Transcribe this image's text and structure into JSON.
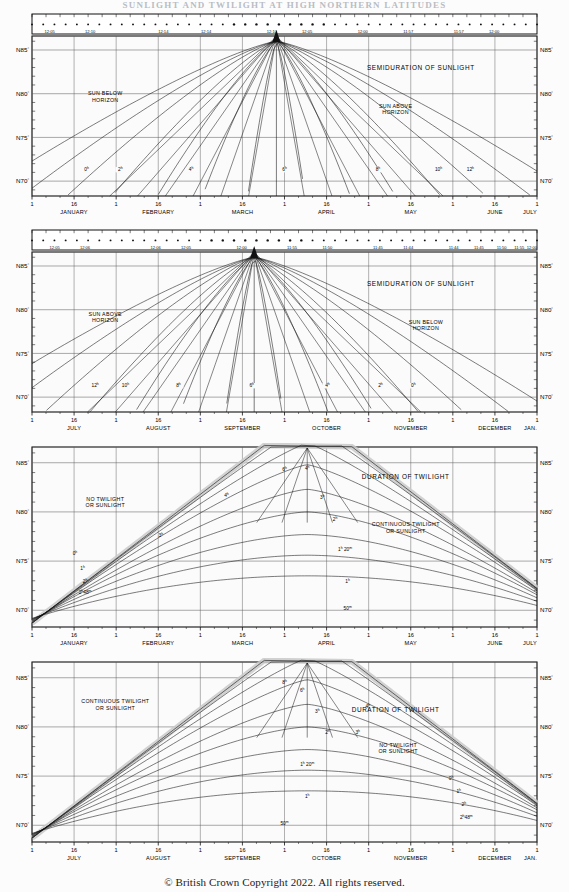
{
  "document": {
    "top_title": "SUNLIGHT AND TWILIGHT AT HIGH NORTHERN LATITUDES",
    "copyright": "© British Crown Copyright 2022. All rights reserved."
  },
  "common": {
    "latitude_ticks": [
      "N85°",
      "N80°",
      "N75°",
      "N70°"
    ],
    "latitude_values": [
      85,
      80,
      75,
      70
    ],
    "day_ticks": [
      "1",
      "16",
      "1",
      "16",
      "1",
      "16",
      "1",
      "16",
      "1",
      "16",
      "1",
      "16",
      "1"
    ],
    "degree_symbol": "°",
    "hour_symbol": "h",
    "minute_symbol": "m"
  },
  "charts": [
    {
      "id": "chart-1-semiduration-jan-jul",
      "title": "SEMIDURATION OF SUNLIGHT",
      "title_x_frac": 0.77,
      "title_y_frac": 0.21,
      "zones": [
        {
          "name": "sun-below-horizon",
          "lines": [
            "SUN BELOW",
            "HORIZON"
          ],
          "x_frac": 0.145,
          "y_frac": 0.37
        },
        {
          "name": "sun-above-horizon",
          "lines": [
            "SUN ABOVE",
            "HORIZON"
          ],
          "x_frac": 0.72,
          "y_frac": 0.45
        }
      ],
      "months": [
        "JANUARY",
        "FEBRUARY",
        "MARCH",
        "APRIL",
        "MAY",
        "JUNE",
        "JULY"
      ],
      "month_last_partial": "JULY",
      "transit_times": [
        "12:05",
        "12:10",
        "12:14",
        "12:14",
        "12:10",
        "12:05",
        "12:00",
        "11:57",
        "11:57",
        "12:00"
      ],
      "transit_time_fracs": [
        0.035,
        0.115,
        0.26,
        0.345,
        0.475,
        0.545,
        0.655,
        0.745,
        0.845,
        0.915
      ],
      "curve_labels": [
        "0h",
        "2h",
        "4h",
        "6h",
        "8h",
        "10h",
        "12h"
      ],
      "curve_label_fracs_x": [
        0.108,
        0.175,
        0.315,
        0.5,
        0.685,
        0.805,
        0.868
      ],
      "curve_label_frac_y": 0.845,
      "apex_x_frac": 0.484
    },
    {
      "id": "chart-2-semiduration-jul-dec",
      "title": "SEMIDURATION OF SUNLIGHT",
      "title_x_frac": 0.77,
      "title_y_frac": 0.21,
      "zones": [
        {
          "name": "sun-above-horizon",
          "lines": [
            "SUN ABOVE",
            "HORIZON"
          ],
          "x_frac": 0.145,
          "y_frac": 0.4
        },
        {
          "name": "sun-below-horizon",
          "lines": [
            "SUN BELOW",
            "HORIZON"
          ],
          "x_frac": 0.78,
          "y_frac": 0.45
        }
      ],
      "months": [
        "JULY",
        "AUGUST",
        "SEPTEMBER",
        "OCTOBER",
        "NOVEMBER",
        "DECEMBER",
        "JAN."
      ],
      "month_last_partial": "JAN.",
      "transit_times": [
        "12:05",
        "12:06",
        "12:06",
        "12:05",
        "12:00",
        "11:55",
        "11:50",
        "11:45",
        "11:44",
        "11:44",
        "11:45",
        "11:50",
        "11:55",
        "12:00"
      ],
      "transit_time_fracs": [
        0.045,
        0.105,
        0.245,
        0.305,
        0.415,
        0.515,
        0.585,
        0.685,
        0.745,
        0.835,
        0.885,
        0.93,
        0.965,
        0.99
      ],
      "curve_labels": [
        "12h",
        "10h",
        "8h",
        "6h",
        "4h",
        "2h",
        "0h"
      ],
      "curve_label_fracs_x": [
        0.125,
        0.185,
        0.29,
        0.435,
        0.585,
        0.69,
        0.755
      ],
      "curve_label_frac_y": 0.845,
      "apex_x_frac": 0.44
    },
    {
      "id": "chart-3-twilight-jan-jul",
      "title": "DURATION OF TWILIGHT",
      "title_x_frac": 0.74,
      "title_y_frac": 0.18,
      "zones": [
        {
          "name": "no-twilight-or-sunlight",
          "lines": [
            "NO TWILIGHT",
            "OR SUNLIGHT"
          ],
          "x_frac": 0.145,
          "y_frac": 0.3
        },
        {
          "name": "continuous-twilight-or-sunlight",
          "lines": [
            "CONTINUOUS TWILIGHT",
            "OR SUNLIGHT"
          ],
          "x_frac": 0.74,
          "y_frac": 0.44
        }
      ],
      "months": [
        "JANUARY",
        "FEBRUARY",
        "MARCH",
        "APRIL",
        "MAY",
        "JUNE",
        "JULY"
      ],
      "month_last_partial": "JULY",
      "curve_labels": [
        "0h",
        "1h",
        "2h",
        "2h48m",
        "3h",
        "4h",
        "6h",
        "4h",
        "3h",
        "2h",
        "1h 20m",
        "1h",
        "50m"
      ],
      "apex_x_frac": 0.545,
      "shaded_band": true
    },
    {
      "id": "chart-4-twilight-jul-dec",
      "title": "DURATION OF TWILIGHT",
      "title_x_frac": 0.72,
      "title_y_frac": 0.28,
      "zones": [
        {
          "name": "continuous-twilight-or-sunlight",
          "lines": [
            "CONTINUOUS TWILIGHT",
            "OR SUNLIGHT"
          ],
          "x_frac": 0.165,
          "y_frac": 0.23
        },
        {
          "name": "no-twilight-or-sunlight",
          "lines": [
            "NO TWILIGHT",
            "OR SUNLIGHT"
          ],
          "x_frac": 0.725,
          "y_frac": 0.47
        }
      ],
      "months": [
        "JULY",
        "AUGUST",
        "SEPTEMBER",
        "OCTOBER",
        "NOVEMBER",
        "DECEMBER",
        "JAN."
      ],
      "month_last_partial": "JAN.",
      "curve_labels": [
        "8h",
        "6h",
        "3h",
        "2h",
        "4h",
        "3h",
        "1h 20m",
        "1h",
        "50m",
        "0h",
        "1h",
        "2h",
        "2h48m"
      ],
      "apex_x_frac": 0.545,
      "shaded_band": true
    }
  ],
  "chart_data": {
    "type": "line",
    "title": "Sunlight and Twilight at High Northern Latitudes",
    "xlabel": "Date (month / day of month)",
    "ylabel": "North Latitude (degrees)",
    "ylim": [
      68.3,
      86.6
    ],
    "ytick_values": [
      85,
      80,
      75,
      70
    ],
    "ytick_labels": [
      "N85°",
      "N80°",
      "N75°",
      "N70°"
    ],
    "grid": true,
    "legend_position": "inline-curve-labels",
    "panels": [
      {
        "name": "SEMIDURATION OF SUNLIGHT (January - July)",
        "x_categories": [
          "JANUARY",
          "FEBRUARY",
          "MARCH",
          "APRIL",
          "MAY",
          "JUNE",
          "JULY"
        ],
        "x_tick_labels": [
          "1",
          "16",
          "1",
          "16",
          "1",
          "16",
          "1",
          "16",
          "1",
          "16",
          "1",
          "16",
          "1"
        ],
        "secondary_axis": {
          "name": "Time of local apparent noon (transit)",
          "labels": [
            "12:05",
            "12:10",
            "12:14",
            "12:14",
            "12:10",
            "12:05",
            "12:00",
            "11:57",
            "11:57",
            "12:00"
          ]
        },
        "series": [
          {
            "name": "0h",
            "note": "semiduration 0 hours — sun on horizon boundary"
          },
          {
            "name": "2h"
          },
          {
            "name": "4h"
          },
          {
            "name": "6h"
          },
          {
            "name": "8h"
          },
          {
            "name": "10h"
          },
          {
            "name": "12h"
          }
        ],
        "regions": [
          "SUN BELOW HORIZON",
          "SUN ABOVE HORIZON"
        ]
      },
      {
        "name": "SEMIDURATION OF SUNLIGHT (July - January)",
        "x_categories": [
          "JULY",
          "AUGUST",
          "SEPTEMBER",
          "OCTOBER",
          "NOVEMBER",
          "DECEMBER",
          "JAN."
        ],
        "x_tick_labels": [
          "1",
          "16",
          "1",
          "16",
          "1",
          "16",
          "1",
          "16",
          "1",
          "16",
          "1",
          "16",
          "1"
        ],
        "secondary_axis": {
          "name": "Time of local apparent noon (transit)",
          "labels": [
            "12:05",
            "12:06",
            "12:06",
            "12:05",
            "12:00",
            "11:55",
            "11:50",
            "11:45",
            "11:44",
            "11:44",
            "11:45",
            "11:50",
            "11:55",
            "12:00"
          ]
        },
        "series": [
          {
            "name": "12h"
          },
          {
            "name": "10h"
          },
          {
            "name": "8h"
          },
          {
            "name": "6h"
          },
          {
            "name": "4h"
          },
          {
            "name": "2h"
          },
          {
            "name": "0h"
          }
        ],
        "regions": [
          "SUN ABOVE HORIZON",
          "SUN BELOW HORIZON"
        ]
      },
      {
        "name": "DURATION OF TWILIGHT (January - July)",
        "x_categories": [
          "JANUARY",
          "FEBRUARY",
          "MARCH",
          "APRIL",
          "MAY",
          "JUNE",
          "JULY"
        ],
        "x_tick_labels": [
          "1",
          "16",
          "1",
          "16",
          "1",
          "16",
          "1",
          "16",
          "1",
          "16",
          "1",
          "16",
          "1"
        ],
        "series": [
          {
            "name": "0h"
          },
          {
            "name": "1h"
          },
          {
            "name": "2h"
          },
          {
            "name": "2h48m"
          },
          {
            "name": "3h"
          },
          {
            "name": "4h"
          },
          {
            "name": "6h"
          },
          {
            "name": "1h 20m"
          },
          {
            "name": "50m"
          }
        ],
        "regions": [
          "NO TWILIGHT OR SUNLIGHT",
          "CONTINUOUS TWILIGHT OR SUNLIGHT"
        ],
        "shaded_band_label": "twilight band between 0h and 2h48m"
      },
      {
        "name": "DURATION OF TWILIGHT (July - January)",
        "x_categories": [
          "JULY",
          "AUGUST",
          "SEPTEMBER",
          "OCTOBER",
          "NOVEMBER",
          "DECEMBER",
          "JAN."
        ],
        "x_tick_labels": [
          "1",
          "16",
          "1",
          "16",
          "1",
          "16",
          "1",
          "16",
          "1",
          "16",
          "1",
          "16",
          "1"
        ],
        "series": [
          {
            "name": "8h"
          },
          {
            "name": "6h"
          },
          {
            "name": "4h"
          },
          {
            "name": "3h"
          },
          {
            "name": "2h"
          },
          {
            "name": "1h 20m"
          },
          {
            "name": "1h"
          },
          {
            "name": "50m"
          },
          {
            "name": "0h"
          },
          {
            "name": "2h48m"
          }
        ],
        "regions": [
          "CONTINUOUS TWILIGHT OR SUNLIGHT",
          "NO TWILIGHT OR SUNLIGHT"
        ],
        "shaded_band_label": "twilight band between 0h and 2h48m"
      }
    ]
  },
  "style": {
    "line_color": "#111111",
    "grid_color": "#555555",
    "band_fill": "#c9c9c9",
    "background": "#fcfcfc"
  }
}
